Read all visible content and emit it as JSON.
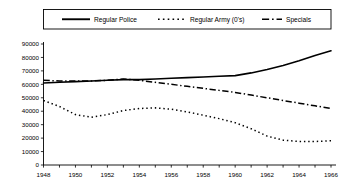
{
  "chart_data": {
    "type": "line",
    "title": "",
    "subtitle": "",
    "xlabel": "",
    "ylabel": "",
    "xlim": [
      1948,
      1966
    ],
    "ylim": [
      0,
      90000
    ],
    "ytick_step": 10000,
    "xtick_step": 1,
    "xtick_label_step": 2,
    "grid": false,
    "legend_position": "top",
    "x": [
      1948,
      1949,
      1950,
      1951,
      1952,
      1953,
      1954,
      1955,
      1956,
      1957,
      1958,
      1959,
      1960,
      1961,
      1962,
      1963,
      1964,
      1965,
      1966
    ],
    "xtick_labels": [
      "1948",
      "1950",
      "1952",
      "1954",
      "1956",
      "1958",
      "1960",
      "1962",
      "1964",
      "1966"
    ],
    "ytick_labels": [
      "0",
      "10000",
      "20000",
      "30000",
      "40000",
      "50000",
      "60000",
      "70000",
      "80000",
      "90000"
    ],
    "series": [
      {
        "name": "Regular Police",
        "style": "solid",
        "color": "#000000",
        "width": 1.6,
        "values": [
          61000,
          61500,
          62000,
          62500,
          63000,
          63500,
          63500,
          64000,
          64500,
          65000,
          65500,
          66000,
          66500,
          68500,
          71000,
          74000,
          77500,
          81500,
          85000
        ]
      },
      {
        "name": "Regular Army (0's)",
        "style": "dotted",
        "color": "#000000",
        "width": 1.5,
        "values": [
          48000,
          43500,
          37500,
          35500,
          37500,
          40500,
          42000,
          42500,
          41500,
          39500,
          37000,
          34500,
          31500,
          27000,
          21500,
          18500,
          17500,
          17500,
          18000
        ]
      },
      {
        "name": "Specials",
        "style": "dashdot",
        "color": "#000000",
        "width": 1.5,
        "values": [
          63000,
          62500,
          62500,
          62500,
          63000,
          64000,
          63000,
          61500,
          60000,
          58500,
          57000,
          55500,
          54000,
          52000,
          50000,
          48000,
          46000,
          44000,
          42000
        ]
      }
    ]
  },
  "legend": {
    "items": [
      {
        "label": "Regular Police",
        "style": "solid"
      },
      {
        "label": "Regular Army (0's)",
        "style": "dotted"
      },
      {
        "label": "Specials",
        "style": "dashdot"
      }
    ]
  }
}
